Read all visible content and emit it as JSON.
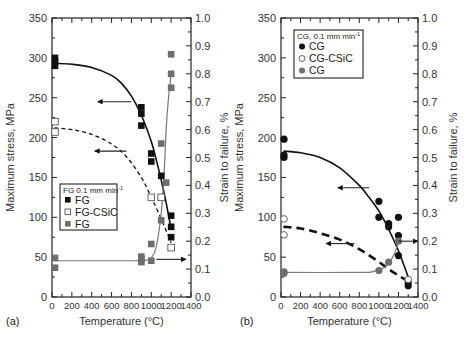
{
  "chart_data": [
    {
      "type": "scatter",
      "panel_label": "(a)",
      "xlabel": "Temperature (°C)",
      "ylabel": "Maximum stress, MPa",
      "y2label": "Strain to failure, %",
      "xlim": [
        0,
        1400
      ],
      "ylim": [
        0,
        350
      ],
      "y2lim": [
        0.0,
        1.0
      ],
      "xticks": [
        0,
        200,
        400,
        600,
        800,
        1000,
        1200,
        1400
      ],
      "yticks": [
        0,
        50,
        100,
        150,
        200,
        250,
        300,
        350
      ],
      "y2ticks": [
        "0.0",
        "0.1",
        "0.2",
        "0.3",
        "0.4",
        "0.5",
        "0.6",
        "0.7",
        "0.8",
        "0.9",
        "1.0"
      ],
      "legend": {
        "title": "FG 0.1 mm min",
        "title_sup": "-1",
        "entries": [
          {
            "label": "FG",
            "marker": "filled-square",
            "color": "#111111"
          },
          {
            "label": "FG-CSiC",
            "marker": "open-square",
            "color": "#555555"
          },
          {
            "label": "FG",
            "marker": "gray-square",
            "color": "#6e6e6e"
          }
        ],
        "position": "center-left"
      },
      "series": [
        {
          "name": "FG (max stress)",
          "axis": "left",
          "marker": "filled-square",
          "points": [
            [
              25,
              300
            ],
            [
              25,
              295
            ],
            [
              25,
              290
            ],
            [
              900,
              238
            ],
            [
              900,
              230
            ],
            [
              900,
              215
            ],
            [
              1000,
              180
            ],
            [
              1000,
              170
            ],
            [
              1100,
              152
            ],
            [
              1200,
              102
            ],
            [
              1200,
              88
            ],
            [
              1200,
              75
            ]
          ],
          "fit": [
            [
              25,
              293
            ],
            [
              200,
              292
            ],
            [
              400,
              288
            ],
            [
              600,
              278
            ],
            [
              700,
              268
            ],
            [
              800,
              252
            ],
            [
              900,
              228
            ],
            [
              1000,
              195
            ],
            [
              1050,
              172
            ],
            [
              1100,
              147
            ],
            [
              1150,
              118
            ],
            [
              1200,
              85
            ]
          ],
          "fit_style": "solid"
        },
        {
          "name": "FG-CSiC (max stress)",
          "axis": "left",
          "marker": "open-square",
          "points": [
            [
              25,
              220
            ],
            [
              25,
              207
            ],
            [
              1000,
              125
            ],
            [
              1100,
              125
            ],
            [
              1200,
              62
            ]
          ],
          "fit": [
            [
              25,
              212
            ],
            [
              200,
              210
            ],
            [
              400,
              204
            ],
            [
              600,
              192
            ],
            [
              750,
              176
            ],
            [
              900,
              150
            ],
            [
              1000,
              125
            ],
            [
              1100,
              98
            ],
            [
              1200,
              68
            ]
          ],
          "fit_style": "dashed"
        },
        {
          "name": "FG (strain to failure)",
          "axis": "right",
          "marker": "gray-square",
          "points": [
            [
              25,
              0.14
            ],
            [
              25,
              0.105
            ],
            [
              900,
              0.145
            ],
            [
              900,
              0.135
            ],
            [
              900,
              0.125
            ],
            [
              1000,
              0.13
            ],
            [
              1000,
              0.19
            ],
            [
              1100,
              0.275
            ],
            [
              1150,
              0.41
            ],
            [
              1100,
              0.55
            ],
            [
              1200,
              0.75
            ],
            [
              1200,
              0.8
            ],
            [
              1200,
              0.87
            ]
          ],
          "fit": [
            [
              25,
              0.13
            ],
            [
              800,
              0.13
            ],
            [
              950,
              0.132
            ],
            [
              1000,
              0.14
            ],
            [
              1050,
              0.18
            ],
            [
              1100,
              0.3
            ],
            [
              1130,
              0.45
            ],
            [
              1150,
              0.6
            ],
            [
              1170,
              0.7
            ],
            [
              1200,
              0.8
            ]
          ],
          "fit_style": "solid-gray"
        }
      ],
      "annotations": [
        {
          "type": "arrow",
          "direction": "left",
          "from": [
            800,
            245
          ],
          "to": [
            460,
            245
          ],
          "meaning": "solid curve reads left axis"
        },
        {
          "type": "arrow",
          "direction": "left",
          "from": [
            750,
            183
          ],
          "to": [
            430,
            183
          ],
          "meaning": "dashed curve reads left axis"
        },
        {
          "type": "arrow",
          "direction": "right",
          "from": [
            1050,
            0.135
          ],
          "to": [
            1350,
            0.135
          ],
          "meaning": "gray curve reads right axis"
        }
      ]
    },
    {
      "type": "scatter",
      "panel_label": "(b)",
      "xlabel": "Temperature (°C)",
      "ylabel": "Maximum stress, MPa",
      "y2label": "Strain to failure, %",
      "xlim": [
        0,
        1400
      ],
      "ylim": [
        0,
        350
      ],
      "y2lim": [
        0.0,
        1.0
      ],
      "xticks": [
        0,
        200,
        400,
        600,
        800,
        1000,
        1200,
        1400
      ],
      "yticks": [
        0,
        50,
        100,
        150,
        200,
        250,
        300,
        350
      ],
      "y2ticks": [
        "0.0",
        "0.1",
        "0.2",
        "0.3",
        "0.4",
        "0.5",
        "0.6",
        "0.7",
        "0.8",
        "0.9",
        "1.0"
      ],
      "legend": {
        "title": "CG, 0.1 mm min",
        "title_sup": "-1",
        "entries": [
          {
            "label": "CG",
            "marker": "filled-circle",
            "color": "#111111"
          },
          {
            "label": "CG-CSiC",
            "marker": "open-circle",
            "color": "#555555"
          },
          {
            "label": "CG",
            "marker": "gray-circle",
            "color": "#6e6e6e"
          }
        ],
        "position": "upper-left"
      },
      "series": [
        {
          "name": "CG (max stress)",
          "axis": "left",
          "marker": "filled-circle",
          "points": [
            [
              25,
              198
            ],
            [
              25,
              178
            ],
            [
              25,
              175
            ],
            [
              1000,
              120
            ],
            [
              1000,
              100
            ],
            [
              1100,
              92
            ],
            [
              1100,
              88
            ],
            [
              1200,
              100
            ],
            [
              1200,
              77
            ],
            [
              1200,
              52
            ],
            [
              1300,
              18
            ],
            [
              1300,
              14
            ]
          ],
          "fit": [
            [
              25,
              183
            ],
            [
              200,
              181
            ],
            [
              400,
              175
            ],
            [
              600,
              162
            ],
            [
              800,
              140
            ],
            [
              900,
              125
            ],
            [
              1000,
              108
            ],
            [
              1100,
              85
            ],
            [
              1200,
              58
            ],
            [
              1250,
              42
            ],
            [
              1300,
              25
            ]
          ],
          "fit_style": "solid"
        },
        {
          "name": "CG-CSiC (max stress)",
          "axis": "left",
          "marker": "open-circle",
          "points": [
            [
              25,
              98
            ],
            [
              25,
              78
            ],
            [
              1300,
              22
            ]
          ],
          "fit": [
            [
              25,
              88
            ],
            [
              200,
              86
            ],
            [
              400,
              80
            ],
            [
              600,
              72
            ],
            [
              800,
              60
            ],
            [
              1000,
              44
            ],
            [
              1100,
              35
            ],
            [
              1200,
              27
            ],
            [
              1300,
              20
            ]
          ],
          "fit_style": "thick-dashed"
        },
        {
          "name": "CG (strain to failure)",
          "axis": "right",
          "marker": "gray-circle",
          "points": [
            [
              25,
              0.09
            ],
            [
              25,
              0.085
            ],
            [
              1000,
              0.095
            ],
            [
              1100,
              0.125
            ],
            [
              1200,
              0.2
            ]
          ],
          "fit": [
            [
              25,
              0.088
            ],
            [
              800,
              0.088
            ],
            [
              950,
              0.092
            ],
            [
              1050,
              0.105
            ],
            [
              1120,
              0.13
            ],
            [
              1170,
              0.165
            ],
            [
              1200,
              0.2
            ]
          ],
          "fit_style": "solid-gray"
        }
      ],
      "annotations": [
        {
          "type": "arrow",
          "direction": "left",
          "from": [
            900,
            137
          ],
          "to": [
            580,
            137
          ],
          "meaning": "solid curve reads left axis"
        },
        {
          "type": "arrow",
          "direction": "left",
          "from": [
            750,
            67
          ],
          "to": [
            460,
            67
          ],
          "meaning": "dashed curve reads left axis"
        },
        {
          "type": "arrow",
          "direction": "right",
          "from": [
            1200,
            0.2
          ],
          "to": [
            1400,
            0.2
          ],
          "meaning": "gray curve reads right axis"
        }
      ]
    }
  ]
}
